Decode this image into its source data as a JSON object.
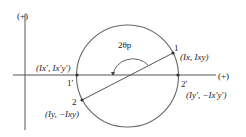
{
  "diagram": {
    "type": "mohr-circle",
    "axes": {
      "horizontal_positive_label": "(+)",
      "vertical_positive_label": "(+)"
    },
    "angle_label": "2θp",
    "points": [
      {
        "id": "1",
        "label": "1",
        "coords": "(Ix, Ixy)"
      },
      {
        "id": "2",
        "label": "2",
        "coords": "(Iy, −Ixy)"
      },
      {
        "id": "1p",
        "label": "1′",
        "coords": "(Ix′, Ix′y′)"
      },
      {
        "id": "2p",
        "label": "2′",
        "coords": "(Iy′, −Ix′y′)"
      }
    ],
    "colors": {
      "line": "#555555",
      "text": "#222222"
    }
  }
}
